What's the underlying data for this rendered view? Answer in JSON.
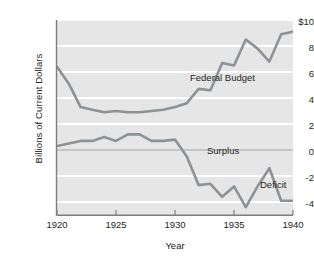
{
  "chart_data": {
    "type": "line",
    "title": "",
    "xlabel": "Year",
    "ylabel": "Billions of Current Dollars",
    "xlim": [
      1920,
      1940
    ],
    "ylim": [
      -5,
      10
    ],
    "grid": true,
    "grid_orientation": "horizontal",
    "legend": "inline-annotations",
    "xticks": [
      "1920",
      "1925",
      "1930",
      "1935",
      "1940"
    ],
    "xtick_values": [
      1920,
      1925,
      1930,
      1935,
      1940
    ],
    "yticks": [
      "$10",
      "8",
      "6",
      "4",
      "2",
      "0",
      "-2",
      "-4"
    ],
    "ytick_values": [
      10,
      8,
      6,
      4,
      2,
      0,
      -2,
      -4
    ],
    "x": [
      1920,
      1921,
      1922,
      1923,
      1924,
      1925,
      1926,
      1927,
      1928,
      1929,
      1930,
      1931,
      1932,
      1933,
      1934,
      1935,
      1936,
      1937,
      1938,
      1939,
      1940
    ],
    "series": [
      {
        "name": "Federal Budget",
        "color": "#8c9296",
        "values": [
          6.4,
          5.1,
          3.3,
          3.1,
          2.9,
          3.0,
          2.9,
          2.9,
          3.0,
          3.1,
          3.3,
          3.6,
          4.7,
          4.6,
          6.7,
          6.5,
          8.5,
          7.8,
          6.8,
          8.9,
          9.1
        ]
      },
      {
        "name": "Surplus/Deficit",
        "color": "#8c9296",
        "values": [
          0.3,
          0.5,
          0.7,
          0.7,
          1.0,
          0.7,
          1.2,
          1.2,
          0.7,
          0.7,
          0.8,
          -0.5,
          -2.7,
          -2.6,
          -3.6,
          -2.8,
          -4.4,
          -2.8,
          -1.4,
          -3.9,
          -3.9
        ]
      }
    ],
    "annotations": [
      {
        "text": "Federal Budget",
        "x": 1931.5,
        "y": 7.1
      },
      {
        "text": "Surplus",
        "x": 1933.0,
        "y": 1.2
      },
      {
        "text": "Deficit",
        "x": 1937.5,
        "y": -1.4
      }
    ],
    "zero_line": 0,
    "colors": {
      "plot_background": "#e6e6e6",
      "gridline": "#ffffff",
      "axis": "#7d7d7d",
      "line": "#8c9296",
      "text": "#231f20"
    }
  }
}
